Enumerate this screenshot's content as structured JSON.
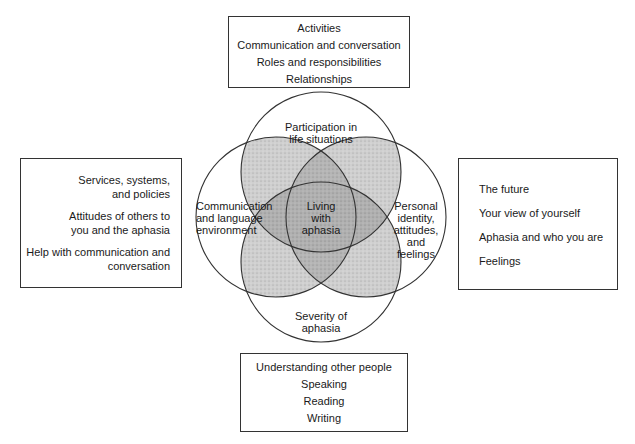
{
  "diagram": {
    "type": "venn",
    "center_label": "Living with aphasia",
    "circles": [
      {
        "id": "top",
        "label": "Participation in life situations",
        "label_lines": [
          "Participation in",
          "life situations"
        ]
      },
      {
        "id": "left",
        "label": "Communication and language environment",
        "label_lines": [
          "Communication",
          "and language",
          "environment"
        ]
      },
      {
        "id": "right",
        "label": "Personal identity, attitudes, and feelings",
        "label_lines": [
          "Personal",
          "identity,",
          "attitudes,",
          "and",
          "feelings"
        ]
      },
      {
        "id": "bottom",
        "label": "Severity of aphasia",
        "label_lines": [
          "Severity of",
          "aphasia"
        ]
      }
    ],
    "center_lines": [
      "Living",
      "with",
      "aphasia"
    ],
    "boxes": {
      "top": {
        "items": [
          "Activities",
          "Communication and conversation",
          "Roles and responsibilities",
          "Relationships"
        ]
      },
      "left": {
        "groups": [
          [
            "Services, systems,",
            "and policies"
          ],
          [
            "Attitudes of others to",
            "you and the aphasia"
          ],
          [
            "Help with communication and",
            "conversation"
          ]
        ]
      },
      "right": {
        "items": [
          "The future",
          "Your view of yourself",
          "Aphasia and who you are",
          "Feelings"
        ]
      },
      "bottom": {
        "items": [
          "Understanding other people",
          "Speaking",
          "Reading",
          "Writing"
        ]
      }
    },
    "colors": {
      "line": "#333333",
      "overlap2": "#c8c8c8",
      "overlap3": "#a9a9a9",
      "background": "#ffffff"
    }
  }
}
